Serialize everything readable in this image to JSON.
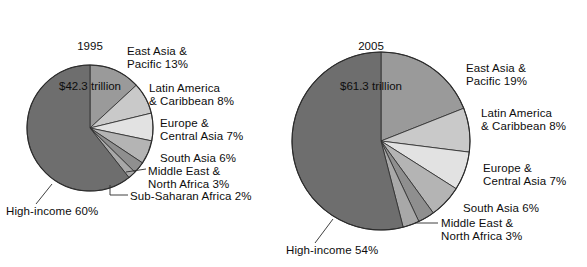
{
  "figure": {
    "background_color": "#ffffff",
    "text_color": "#0d0d0d"
  },
  "chart_data": [
    {
      "type": "pie",
      "title": "1995",
      "subtitle": "$42.3 trillion",
      "total_label": "$42.3 trillion",
      "start_angle_deg": 0,
      "direction": "clockwise",
      "categories": [
        "East Asia & Pacific",
        "Latin America & Caribbean",
        "Europe & Central Asia",
        "South Asia",
        "Middle East & North Africa",
        "Sub-Saharan Africa",
        "High-income"
      ],
      "values": [
        13,
        8,
        7,
        6,
        3,
        2,
        60
      ],
      "value_unit": "%",
      "colors": [
        "#9a9a9a",
        "#c9c9c9",
        "#e2e2e2",
        "#b4b4b4",
        "#8f8f8f",
        "#a8a8a8",
        "#6e6e6e"
      ],
      "labels": [
        "East Asia &\nPacific 13%",
        "Latin America\n& Caribbean 8%",
        "Europe &\nCentral Asia 7%",
        "South Asia 6%",
        "Middle East &\nNorth Africa 3%",
        "Sub-Saharan Africa 2%",
        "High-income 60%"
      ],
      "legend": "none",
      "grid": false
    },
    {
      "type": "pie",
      "title": "2005",
      "subtitle": "$61.3 trillion",
      "total_label": "$61.3 trillion",
      "start_angle_deg": 0,
      "direction": "clockwise",
      "categories": [
        "East Asia & Pacific",
        "Latin America & Caribbean",
        "Europe & Central Asia",
        "South Asia",
        "Middle East & North Africa",
        "Sub-Saharan Africa",
        "High-income"
      ],
      "values": [
        19,
        8,
        7,
        6,
        3,
        3,
        54
      ],
      "value_unit": "%",
      "colors": [
        "#9a9a9a",
        "#c9c9c9",
        "#e2e2e2",
        "#b4b4b4",
        "#8f8f8f",
        "#a8a8a8",
        "#6e6e6e"
      ],
      "labels": [
        "East Asia &\nPacific 19%",
        "Latin America\n& Caribbean 8%",
        "Europe &\nCentral Asia 7%",
        "South Asia 6%",
        "Middle East &\nNorth Africa 3%",
        "",
        "High-income 54%"
      ],
      "legend": "none",
      "grid": false
    }
  ],
  "left_chart": {
    "title_line1": "1995",
    "title_line2": "$42.3 trillion",
    "labels": {
      "east_asia": "East Asia &\nPacific 13%",
      "latin_america": "Latin America\n& Caribbean 8%",
      "europe": "Europe &\nCentral Asia 7%",
      "south_asia": "South Asia 6%",
      "middle_east": "Middle East &\nNorth Africa 3%",
      "sub_saharan": "Sub-Saharan Africa 2%",
      "high_income": "High-income 60%"
    }
  },
  "right_chart": {
    "title_line1": "2005",
    "title_line2": "$61.3 trillion",
    "labels": {
      "east_asia": "East Asia &\nPacific 19%",
      "latin_america": "Latin America\n& Caribbean 8%",
      "europe": "Europe &\nCentral Asia 7%",
      "south_asia": "South Asia 6%",
      "middle_east": "Middle East &\nNorth Africa 3%",
      "high_income": "High-income 54%"
    }
  }
}
